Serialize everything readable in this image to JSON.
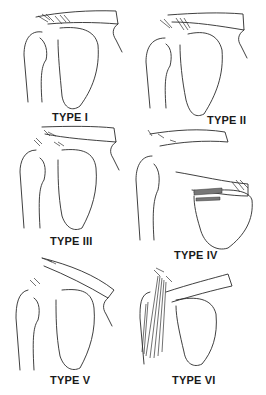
{
  "figure": {
    "ink_color": "#2a2a2a",
    "background": "#ffffff",
    "panels": [
      {
        "id": "type-1",
        "label": "TYPE I"
      },
      {
        "id": "type-2",
        "label": "TYPE II"
      },
      {
        "id": "type-3",
        "label": "TYPE III"
      },
      {
        "id": "type-4",
        "label": "TYPE IV"
      },
      {
        "id": "type-5",
        "label": "TYPE V"
      },
      {
        "id": "type-6",
        "label": "TYPE VI"
      }
    ]
  }
}
